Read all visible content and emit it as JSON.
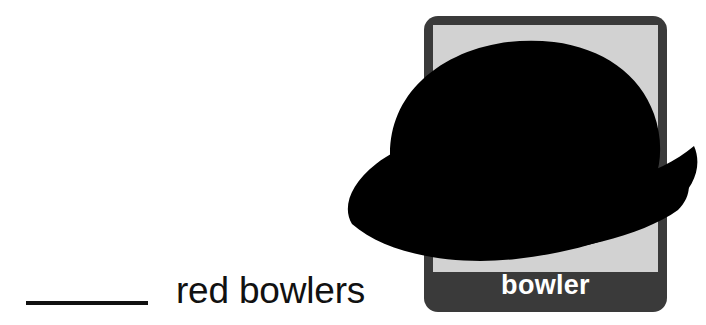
{
  "page": {
    "background_color": "#ffffff",
    "width": 706,
    "height": 325
  },
  "exercise": {
    "blank_placeholder": "",
    "prompt_text": "red bowlers",
    "full_sentence": "______ red bowlers",
    "text_color": "#111111",
    "blank_line_color": "#111111"
  },
  "picture_card": {
    "label": "bowler",
    "label_color": "#ffffff",
    "frame_color": "#3a3a3a",
    "panel_color": "#d2d2d2",
    "footer_color": "#3a3a3a",
    "illustration": {
      "name": "bowler-hat",
      "color": "#000000",
      "description": "black bowler hat"
    }
  }
}
